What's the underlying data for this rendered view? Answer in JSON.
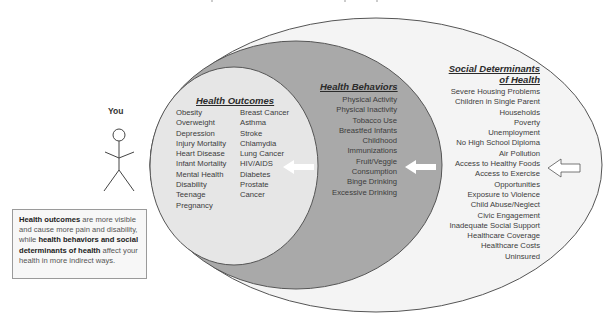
{
  "diagram": {
    "person": {
      "label": "You",
      "icon": "stick-figure-icon"
    },
    "note": {
      "parts": [
        {
          "text": "Health outcomes",
          "bold": true
        },
        {
          "text": " are more visible and cause more pain and disability, while ",
          "bold": false
        },
        {
          "text": "health behaviors and social determinants of health",
          "bold": true
        },
        {
          "text": " affect your health in more indirect ways.",
          "bold": false
        }
      ]
    },
    "health_outcomes": {
      "title": "Health Outcomes",
      "fill": "#e6e6e6",
      "column_left": [
        "Obesity",
        "Overweight",
        "Depression",
        "Injury Mortality",
        "Heart Disease",
        "Infant Mortality",
        "Mental Health",
        "Disability",
        "Teenage",
        "Pregnancy"
      ],
      "column_right": [
        "Breast Cancer",
        "Asthma",
        "Stroke",
        "Chlamydia",
        "Lung Cancer",
        "HIV/AIDS",
        "Diabetes",
        "Prostate",
        "Cancer"
      ]
    },
    "health_behaviors": {
      "title": "Health Behaviors",
      "fill": "#a9a9a9",
      "items": [
        "Physical Activity",
        "Physical Inactivity",
        "Tobacco Use",
        "Breastfed Infants",
        "Childhood",
        "Immunizations",
        "Fruit/Veggie",
        "Consumption",
        "Binge Drinking",
        "Excessive Drinking"
      ]
    },
    "social_determinants": {
      "title_line1": "Social Determinants",
      "title_line2": "of Health",
      "fill": "#f4f4f4",
      "items": [
        "Severe Housing Problems",
        "Children in Single Parent",
        "Households",
        "Poverty",
        "Unemployment",
        "No High School Diploma",
        "Air Pollution",
        "Access to Healthy Foods",
        "Access to Exercise",
        "Opportunities",
        "Exposure to Violence",
        "Child Abuse/Neglect",
        "Civic Engagement",
        "Inadequate Social Support",
        "Healthcare Coverage",
        "Healthcare Costs",
        "Uninsured"
      ]
    },
    "arrows": [
      {
        "name": "arrow-behaviors-to-outcomes",
        "style": "white-filled",
        "direction": "left"
      },
      {
        "name": "arrow-determinants-to-behaviors",
        "style": "white-filled",
        "direction": "left"
      },
      {
        "name": "arrow-external-to-determinants",
        "style": "outline",
        "direction": "left"
      }
    ],
    "colors": {
      "outline": "#555555",
      "outer_fill": "#f4f4f4",
      "middle_fill": "#a9a9a9",
      "inner_fill": "#e6e6e6"
    }
  }
}
